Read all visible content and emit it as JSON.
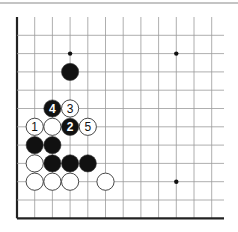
{
  "diagram": {
    "type": "go-board-fragment",
    "grid": {
      "cols": 12,
      "rows": 12,
      "origin_x": 17,
      "origin_y": 17,
      "spacing_x": 17.7,
      "spacing_y": 18.3,
      "line_extent_right": 224,
      "line_color": "#9a9a9a",
      "edge_color": "#222222"
    },
    "hoshi": [
      {
        "col": 3,
        "row": 2
      },
      {
        "col": 9,
        "row": 2
      },
      {
        "col": 9,
        "row": 9
      }
    ],
    "stones": [
      {
        "col": 3,
        "row": 3,
        "color": "black",
        "label": ""
      },
      {
        "col": 2,
        "row": 5,
        "color": "black",
        "label": "4"
      },
      {
        "col": 3,
        "row": 5,
        "color": "white",
        "label": "3"
      },
      {
        "col": 1,
        "row": 6,
        "color": "white",
        "label": "1"
      },
      {
        "col": 2,
        "row": 6,
        "color": "white",
        "label": ""
      },
      {
        "col": 3,
        "row": 6,
        "color": "black",
        "label": "2"
      },
      {
        "col": 4,
        "row": 6,
        "color": "white",
        "label": "5"
      },
      {
        "col": 1,
        "row": 7,
        "color": "black",
        "label": ""
      },
      {
        "col": 2,
        "row": 7,
        "color": "black",
        "label": ""
      },
      {
        "col": 1,
        "row": 8,
        "color": "white",
        "label": ""
      },
      {
        "col": 2,
        "row": 8,
        "color": "black",
        "label": ""
      },
      {
        "col": 3,
        "row": 8,
        "color": "black",
        "label": ""
      },
      {
        "col": 4,
        "row": 8,
        "color": "black",
        "label": ""
      },
      {
        "col": 1,
        "row": 9,
        "color": "white",
        "label": ""
      },
      {
        "col": 2,
        "row": 9,
        "color": "white",
        "label": ""
      },
      {
        "col": 3,
        "row": 9,
        "color": "white",
        "label": ""
      },
      {
        "col": 5,
        "row": 9,
        "color": "white",
        "label": ""
      }
    ],
    "colors": {
      "black_stone": "#111111",
      "white_stone": "#ffffff",
      "stone_outline": "#333333"
    }
  }
}
